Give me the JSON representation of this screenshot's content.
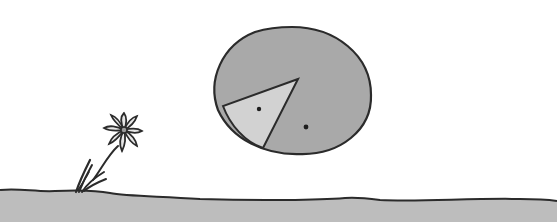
{
  "scene": {
    "description": "Hand-drawn illustration: a large grey circle with a light triangular wedge containing two dots, floating above a grey ground line, with a small daisy-like flower growing from the ground at left.",
    "colors": {
      "background": "#ffffff",
      "ground": "#bdbdbd",
      "circle": "#a9a9a9",
      "wedge": "#d2d2d2",
      "outline": "#2b2b2b"
    },
    "elements": [
      "circle",
      "wedge",
      "left-dot",
      "right-dot",
      "flower",
      "ground"
    ]
  }
}
